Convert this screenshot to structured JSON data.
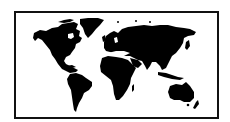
{
  "image": {
    "subject": "World map silhouette",
    "alt": "Black silhouette world map inside a rectangular black frame",
    "colors": {
      "land": "#000000",
      "background": "#ffffff",
      "frame": "#111111"
    },
    "continents": [
      "North America",
      "Greenland",
      "South America",
      "Europe",
      "Asia",
      "Africa",
      "Australia"
    ]
  }
}
